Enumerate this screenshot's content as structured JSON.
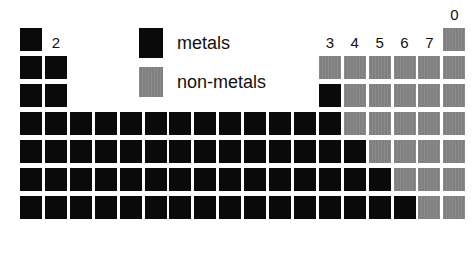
{
  "figure": {
    "background_color": "#ffffff"
  },
  "colors": {
    "metal": "#0a0a0a",
    "nonmetal": "#808080",
    "background": "#ffffff",
    "gridline": "#ffffff",
    "label_text": "#111111"
  },
  "legend": {
    "position": "top-center",
    "entries": [
      {
        "label": "metals",
        "swatch": "metal",
        "color": "#0a0a0a"
      },
      {
        "label": "non-metals",
        "swatch": "nonmetal",
        "color": "#808080"
      }
    ]
  },
  "group_labels": [
    {
      "text": "1",
      "column": 1
    },
    {
      "text": "2",
      "column": 2
    },
    {
      "text": "3",
      "column": 13
    },
    {
      "text": "4",
      "column": 14
    },
    {
      "text": "5",
      "column": 15
    },
    {
      "text": "6",
      "column": 16
    },
    {
      "text": "7",
      "column": 17
    },
    {
      "text": "0",
      "column": 18
    }
  ],
  "chart_data": {
    "type": "heatmap",
    "xlabel": "",
    "ylabel": "",
    "categories": [
      "1",
      "2",
      "3",
      "4",
      "5",
      "6",
      "7",
      "0"
    ],
    "legend_position": "top-center",
    "grid": true,
    "columns": 18,
    "rows": 7,
    "cell_states": [
      "metal",
      "nonmetal",
      "empty"
    ],
    "rows_data": [
      {
        "period": 1,
        "cells": [
          "metal",
          "empty",
          "empty",
          "empty",
          "empty",
          "empty",
          "empty",
          "empty",
          "empty",
          "empty",
          "empty",
          "empty",
          "empty",
          "empty",
          "empty",
          "empty",
          "empty",
          "nonmetal"
        ]
      },
      {
        "period": 2,
        "cells": [
          "metal",
          "metal",
          "empty",
          "empty",
          "empty",
          "empty",
          "empty",
          "empty",
          "empty",
          "empty",
          "empty",
          "empty",
          "nonmetal",
          "nonmetal",
          "nonmetal",
          "nonmetal",
          "nonmetal",
          "nonmetal"
        ]
      },
      {
        "period": 3,
        "cells": [
          "metal",
          "metal",
          "empty",
          "empty",
          "empty",
          "empty",
          "empty",
          "empty",
          "empty",
          "empty",
          "empty",
          "empty",
          "metal",
          "nonmetal",
          "nonmetal",
          "nonmetal",
          "nonmetal",
          "nonmetal"
        ]
      },
      {
        "period": 4,
        "cells": [
          "metal",
          "metal",
          "metal",
          "metal",
          "metal",
          "metal",
          "metal",
          "metal",
          "metal",
          "metal",
          "metal",
          "metal",
          "metal",
          "nonmetal",
          "nonmetal",
          "nonmetal",
          "nonmetal",
          "nonmetal"
        ]
      },
      {
        "period": 5,
        "cells": [
          "metal",
          "metal",
          "metal",
          "metal",
          "metal",
          "metal",
          "metal",
          "metal",
          "metal",
          "metal",
          "metal",
          "metal",
          "metal",
          "metal",
          "nonmetal",
          "nonmetal",
          "nonmetal",
          "nonmetal"
        ]
      },
      {
        "period": 6,
        "cells": [
          "metal",
          "metal",
          "metal",
          "metal",
          "metal",
          "metal",
          "metal",
          "metal",
          "metal",
          "metal",
          "metal",
          "metal",
          "metal",
          "metal",
          "metal",
          "nonmetal",
          "nonmetal",
          "nonmetal"
        ]
      },
      {
        "period": 7,
        "cells": [
          "metal",
          "metal",
          "metal",
          "metal",
          "metal",
          "metal",
          "metal",
          "metal",
          "metal",
          "metal",
          "metal",
          "metal",
          "metal",
          "metal",
          "metal",
          "metal",
          "nonmetal",
          "nonmetal"
        ]
      }
    ],
    "counts": {
      "metal": 94,
      "nonmetal": 24,
      "empty": 8
    }
  },
  "layout": {
    "origin_x": 20,
    "origin_y": 56,
    "cell_w": 22,
    "cell_h": 23,
    "pitch_x": 24.9,
    "pitch_y": 28.0,
    "period1_offset_y": -28
  }
}
